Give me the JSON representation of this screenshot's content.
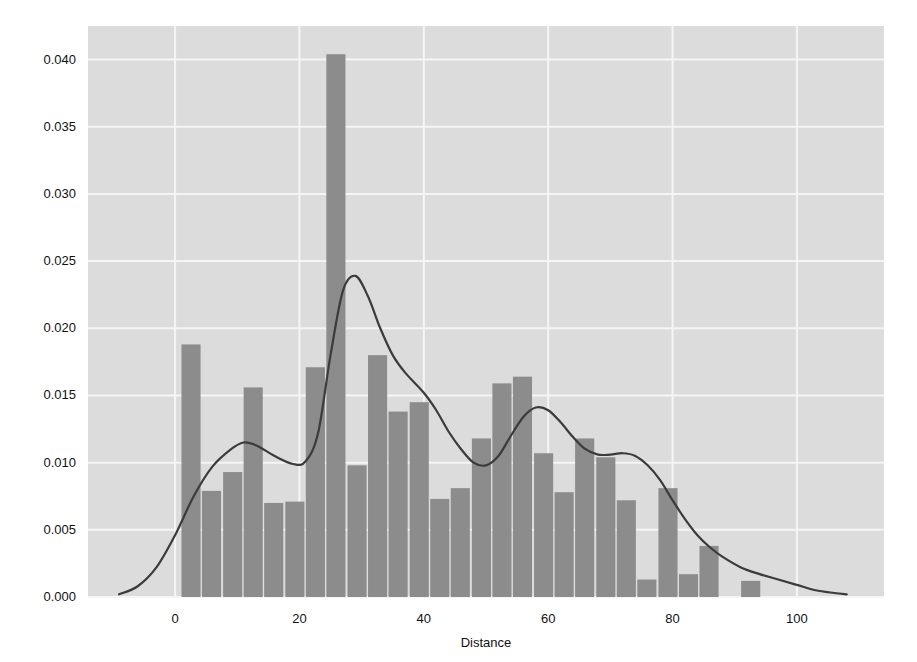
{
  "chart_data": {
    "type": "bar",
    "title": "",
    "subtitle": "",
    "xlabel": "Distance",
    "ylabel": "",
    "xlim": [
      -14,
      114
    ],
    "ylim": [
      0.0,
      0.0425
    ],
    "xticks": [
      0,
      20,
      40,
      60,
      80,
      100
    ],
    "xticklabels": [
      "0",
      "20",
      "40",
      "60",
      "80",
      "100"
    ],
    "yticks": [
      0.0,
      0.005,
      0.01,
      0.015,
      0.02,
      0.025,
      0.03,
      0.035,
      0.04
    ],
    "yticklabels": [
      "0.000",
      "0.005",
      "0.010",
      "0.015",
      "0.020",
      "0.025",
      "0.030",
      "0.035",
      "0.040"
    ],
    "grid": true,
    "legend": false,
    "legend_position": "none",
    "bar_width": 3.33,
    "bin_edges": [
      0.9,
      4.2,
      7.6,
      10.9,
      14.2,
      17.6,
      20.9,
      24.2,
      27.6,
      30.9,
      34.2,
      37.6,
      40.9,
      44.2,
      47.6,
      50.9,
      54.2,
      57.6,
      60.9,
      64.2,
      67.6,
      70.9,
      74.2,
      77.6,
      80.9,
      84.2,
      87.6,
      90.9,
      94.2,
      97.6
    ],
    "categories": [
      2.5,
      5.9,
      9.2,
      12.5,
      15.9,
      19.2,
      22.5,
      25.9,
      29.2,
      32.5,
      35.9,
      39.2,
      42.5,
      45.9,
      49.2,
      52.5,
      55.9,
      59.2,
      62.5,
      65.9,
      69.2,
      72.5,
      75.9,
      79.2,
      82.5,
      85.9,
      89.2,
      92.5,
      95.9
    ],
    "values": [
      0.0188,
      0.0079,
      0.0093,
      0.0156,
      0.007,
      0.0071,
      0.0171,
      0.0404,
      0.0098,
      0.018,
      0.0138,
      0.0145,
      0.0073,
      0.0081,
      0.0118,
      0.0159,
      0.0164,
      0.0107,
      0.0078,
      0.0118,
      0.0104,
      0.0072,
      0.0013,
      0.0081,
      0.0017,
      0.0038,
      0.0,
      0.0012,
      0.0
    ],
    "series": [
      {
        "name": "histogram",
        "kind": "bar",
        "color": "#8c8c8c",
        "values": [
          0.0188,
          0.0079,
          0.0093,
          0.0156,
          0.007,
          0.0071,
          0.0171,
          0.0404,
          0.0098,
          0.018,
          0.0138,
          0.0145,
          0.0073,
          0.0081,
          0.0118,
          0.0159,
          0.0164,
          0.0107,
          0.0078,
          0.0118,
          0.0104,
          0.0072,
          0.0013,
          0.0081,
          0.0017,
          0.0038,
          0.0,
          0.0012,
          0.0
        ]
      },
      {
        "name": "kde",
        "kind": "line",
        "color": "#3b3b3b",
        "x": [
          -9,
          -6,
          -3,
          0,
          3,
          6,
          9,
          11,
          13,
          16,
          19,
          21,
          23,
          25,
          27,
          29,
          31,
          33,
          35,
          37,
          40,
          42,
          44,
          46,
          48,
          50,
          52,
          54,
          56,
          58,
          60,
          62,
          64,
          66,
          68,
          70,
          72,
          74,
          76,
          78,
          80,
          82,
          84,
          86,
          88,
          91,
          94,
          97,
          100,
          103,
          106,
          108
        ],
        "y": [
          0.0002,
          0.0008,
          0.0022,
          0.0046,
          0.0075,
          0.0097,
          0.011,
          0.0115,
          0.0113,
          0.0105,
          0.0099,
          0.0101,
          0.0122,
          0.018,
          0.0228,
          0.0239,
          0.0224,
          0.02,
          0.018,
          0.0167,
          0.0152,
          0.0139,
          0.0123,
          0.011,
          0.01,
          0.0098,
          0.0105,
          0.012,
          0.0134,
          0.0141,
          0.0139,
          0.013,
          0.0119,
          0.011,
          0.0106,
          0.0106,
          0.0107,
          0.0105,
          0.0098,
          0.0087,
          0.0072,
          0.0058,
          0.0046,
          0.0037,
          0.003,
          0.0022,
          0.0017,
          0.0013,
          0.0009,
          0.0005,
          0.0003,
          0.0002
        ]
      }
    ],
    "colors": {
      "plot_background": "#dcdcdc",
      "figure_background": "#ffffff",
      "bar": "#8c8c8c",
      "kde_line": "#3b3b3b",
      "gridline": "#f5f5f5",
      "tick_text": "#111111"
    }
  }
}
